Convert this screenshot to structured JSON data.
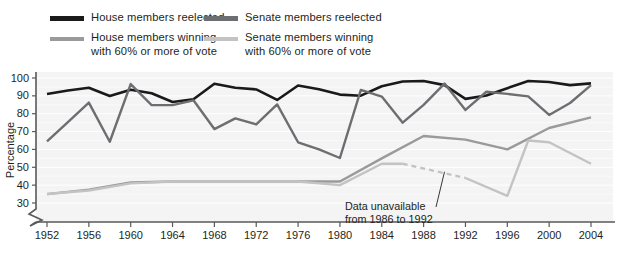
{
  "legend": {
    "items": [
      {
        "label": "House members reelected",
        "color": "#1a1a1a",
        "weight": "thick",
        "name": "legend-house-reelected"
      },
      {
        "label": "House members winning\nwith 60% or more of vote",
        "color": "#9a9a9a",
        "weight": "normal",
        "name": "legend-house-60"
      },
      {
        "label": "Senate members reelected",
        "color": "#6d6e71",
        "weight": "thick",
        "name": "legend-senate-reelected"
      },
      {
        "label": "Senate members winning\nwith 60% or more of vote",
        "color": "#c3c3c3",
        "weight": "normal",
        "name": "legend-senate-60"
      }
    ]
  },
  "annotation": {
    "line1": "Data unavailable",
    "line2": "from 1986 to 1992"
  },
  "chart_data": {
    "type": "line",
    "title": "",
    "xlabel": "",
    "ylabel": "Percentage",
    "x": [
      1952,
      1956,
      1960,
      1964,
      1968,
      1972,
      1976,
      1980,
      1984,
      1988,
      1992,
      1996,
      2000,
      2004
    ],
    "xtick_labels": [
      "1952",
      "1956",
      "1960",
      "1964",
      "1968",
      "1972",
      "1976",
      "1980",
      "1984",
      "1988",
      "1992",
      "1996",
      "2000",
      "2004"
    ],
    "xlim": [
      1952,
      2004
    ],
    "ylim": [
      30,
      100
    ],
    "yticks": [
      30,
      40,
      50,
      60,
      70,
      80,
      90,
      100
    ],
    "ytick_labels": [
      "30",
      "40",
      "50",
      "60",
      "70",
      "80",
      "90",
      "100"
    ],
    "axis_break": true,
    "grid": "horizontal-white-on-gray",
    "legend_position": "above-plot",
    "series": [
      {
        "name": "House members reelected",
        "color": "#1a1a1a",
        "width": 2.6,
        "x": [
          1952,
          1954,
          1956,
          1958,
          1960,
          1962,
          1964,
          1966,
          1968,
          1970,
          1972,
          1974,
          1976,
          1978,
          1980,
          1982,
          1984,
          1986,
          1988,
          1990,
          1992,
          1994,
          1996,
          1998,
          2000,
          2002,
          2004
        ],
        "values": [
          91,
          93,
          94.5,
          89.9,
          93.4,
          91.5,
          86.6,
          88.1,
          96.8,
          94.5,
          93.6,
          87.7,
          95.8,
          93.7,
          90.7,
          90.1,
          95.4,
          98,
          98.3,
          96,
          88.3,
          90.2,
          94.3,
          98.3,
          97.8,
          96,
          97
        ]
      },
      {
        "name": "Senate members reelected",
        "color": "#6d6e71",
        "width": 2.4,
        "x": [
          1952,
          1954,
          1956,
          1958,
          1960,
          1962,
          1964,
          1966,
          1968,
          1970,
          1972,
          1974,
          1976,
          1978,
          1980,
          1982,
          1984,
          1986,
          1988,
          1990,
          1992,
          1994,
          1996,
          1998,
          2000,
          2002,
          2004
        ],
        "values": [
          64.5,
          75.3,
          86.2,
          64.3,
          96.6,
          84.8,
          84.8,
          87.5,
          71.4,
          77.4,
          74,
          85.2,
          64,
          60,
          55.2,
          93.3,
          89.6,
          75,
          85,
          96.9,
          82.1,
          92.3,
          91.1,
          89.7,
          79.3,
          86,
          96
        ]
      },
      {
        "name": "House members winning with 60% or more of vote",
        "color": "#9a9a9a",
        "width": 2.4,
        "x": [
          1952,
          1956,
          1960,
          1964,
          1968,
          1972,
          1976,
          1980,
          1984,
          1988,
          1992,
          1996,
          2000,
          2004
        ],
        "values": [
          35,
          37.5,
          41.5,
          42,
          42,
          42,
          42,
          42,
          55,
          67.5,
          65.5,
          60,
          72,
          78
        ]
      },
      {
        "name": "Senate members winning with 60% or more of vote",
        "color": "#c3c3c3",
        "width": 2.4,
        "segments": [
          {
            "style": "solid",
            "x": [
              1952,
              1956,
              1960,
              1964,
              1968,
              1972,
              1976,
              1980,
              1984,
              1986
            ],
            "values": [
              35,
              37,
              41,
              42,
              42,
              42,
              42,
              40,
              52,
              52
            ]
          },
          {
            "style": "dashed",
            "x": [
              1986,
              1992
            ],
            "values": [
              52,
              44
            ]
          },
          {
            "style": "solid",
            "x": [
              1992,
              1996,
              1998,
              2000,
              2004
            ],
            "values": [
              44,
              34,
              65,
              64,
              52
            ]
          }
        ]
      }
    ],
    "annotations": [
      {
        "text": "Data unavailable from 1986 to 1992",
        "points_to_x": 1990,
        "points_to_y": 47
      }
    ]
  }
}
